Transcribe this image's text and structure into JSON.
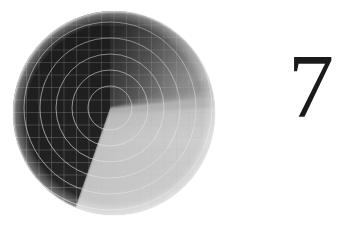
{
  "figure": {
    "plate_number": "7",
    "caption": "",
    "background_color": "#ffffff"
  },
  "scan_display": {
    "name": "circular-scan-display",
    "shape": "circle",
    "center_x": 114,
    "center_y": 113,
    "radius": 102,
    "dark_sector_color": "#151515",
    "bright_sector_color": "#d8d8d8",
    "mid_gradient_color": "#6e6e6e",
    "grid_line_color": "#bdbdbd",
    "arc_line_color": "#f2f2f2",
    "grid_spacing_px": 12.5,
    "sweep_apex_x": 110,
    "sweep_apex_y": 108,
    "sweep_start_angle_deg": 0,
    "sweep_end_angle_deg": 118,
    "arc_radii": [
      22,
      38,
      54,
      70,
      86,
      102,
      118
    ],
    "arc_count": 7
  }
}
